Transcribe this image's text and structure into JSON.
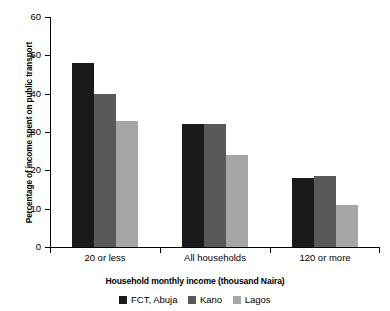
{
  "chart_data": {
    "type": "bar",
    "title": "",
    "xlabel": "Household monthly income (thousand Naira)",
    "ylabel": "Percentage of income spent on public transport",
    "categories": [
      "20 or less",
      "All households",
      "120 or more"
    ],
    "series": [
      {
        "name": "FCT, Abuja",
        "color": "#1a1a1a",
        "values": [
          48,
          32,
          18
        ]
      },
      {
        "name": "Kano",
        "color": "#595959",
        "values": [
          40,
          32,
          18.5
        ]
      },
      {
        "name": "Lagos",
        "color": "#a6a6a6",
        "values": [
          33,
          24,
          11
        ]
      }
    ],
    "ylim": [
      0,
      60
    ],
    "yticks": [
      0,
      10,
      20,
      30,
      40,
      50,
      60
    ],
    "ytick_labels": [
      "0",
      "10",
      "20",
      "30",
      "40",
      "50",
      "60"
    ],
    "grid": false,
    "legend_position": "bottom"
  }
}
